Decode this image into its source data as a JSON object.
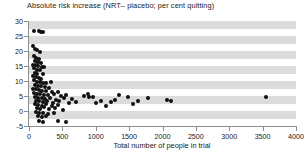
{
  "chart_data": {
    "type": "scatter",
    "title": "Absolute risk increase (NRT– placebo; per cent quitting)",
    "xlabel": "Total number of people in trial",
    "ylabel": "",
    "xlim": [
      0,
      4000
    ],
    "ylim": [
      -5,
      30
    ],
    "xticks": [
      0,
      500,
      1000,
      1500,
      2000,
      2500,
      3000,
      3500,
      4000
    ],
    "yticks": [
      -5,
      0,
      5,
      10,
      15,
      20,
      25,
      30
    ],
    "grid": "horizontal-bands",
    "legend": "none",
    "marker": {
      "shape": "circle",
      "color": "#101010",
      "size_px": 4
    },
    "background_bands": {
      "color": "#dcdcdc",
      "alternating_with": "#ffffff",
      "step": 2.5
    },
    "points": [
      {
        "x": 70,
        "y": 26.8
      },
      {
        "x": 150,
        "y": 26.6
      },
      {
        "x": 185,
        "y": 26.4
      },
      {
        "x": 205,
        "y": 26.5
      },
      {
        "x": 60,
        "y": 21.6
      },
      {
        "x": 90,
        "y": 20.6
      },
      {
        "x": 120,
        "y": 20.2
      },
      {
        "x": 165,
        "y": 19.6
      },
      {
        "x": 75,
        "y": 18.4
      },
      {
        "x": 110,
        "y": 17.6
      },
      {
        "x": 150,
        "y": 17.4
      },
      {
        "x": 95,
        "y": 16.6
      },
      {
        "x": 130,
        "y": 16.2
      },
      {
        "x": 175,
        "y": 16.0
      },
      {
        "x": 60,
        "y": 15.4
      },
      {
        "x": 100,
        "y": 15.2
      },
      {
        "x": 140,
        "y": 15.0
      },
      {
        "x": 190,
        "y": 14.8
      },
      {
        "x": 230,
        "y": 14.6
      },
      {
        "x": 70,
        "y": 14.2
      },
      {
        "x": 115,
        "y": 13.8
      },
      {
        "x": 160,
        "y": 13.6
      },
      {
        "x": 85,
        "y": 12.8
      },
      {
        "x": 125,
        "y": 12.4
      },
      {
        "x": 205,
        "y": 12.2
      },
      {
        "x": 55,
        "y": 11.6
      },
      {
        "x": 100,
        "y": 11.2
      },
      {
        "x": 145,
        "y": 11.0
      },
      {
        "x": 185,
        "y": 10.8
      },
      {
        "x": 75,
        "y": 10.2
      },
      {
        "x": 120,
        "y": 9.8
      },
      {
        "x": 165,
        "y": 9.6
      },
      {
        "x": 215,
        "y": 9.4
      },
      {
        "x": 260,
        "y": 9.2
      },
      {
        "x": 330,
        "y": 9.6
      },
      {
        "x": 90,
        "y": 8.6
      },
      {
        "x": 135,
        "y": 8.4
      },
      {
        "x": 180,
        "y": 8.2
      },
      {
        "x": 235,
        "y": 8.0
      },
      {
        "x": 300,
        "y": 7.8
      },
      {
        "x": 65,
        "y": 7.4
      },
      {
        "x": 110,
        "y": 7.2
      },
      {
        "x": 155,
        "y": 7.0
      },
      {
        "x": 200,
        "y": 6.8
      },
      {
        "x": 255,
        "y": 6.6
      },
      {
        "x": 350,
        "y": 6.4
      },
      {
        "x": 430,
        "y": 6.2
      },
      {
        "x": 80,
        "y": 6.0
      },
      {
        "x": 125,
        "y": 5.8
      },
      {
        "x": 170,
        "y": 5.6
      },
      {
        "x": 225,
        "y": 5.4
      },
      {
        "x": 290,
        "y": 5.2
      },
      {
        "x": 380,
        "y": 5.6
      },
      {
        "x": 480,
        "y": 5.0
      },
      {
        "x": 560,
        "y": 5.4
      },
      {
        "x": 95,
        "y": 4.6
      },
      {
        "x": 140,
        "y": 4.4
      },
      {
        "x": 190,
        "y": 4.2
      },
      {
        "x": 245,
        "y": 4.0
      },
      {
        "x": 320,
        "y": 4.4
      },
      {
        "x": 410,
        "y": 3.8
      },
      {
        "x": 520,
        "y": 4.2
      },
      {
        "x": 640,
        "y": 4.0
      },
      {
        "x": 105,
        "y": 3.4
      },
      {
        "x": 150,
        "y": 3.2
      },
      {
        "x": 210,
        "y": 3.0
      },
      {
        "x": 275,
        "y": 3.4
      },
      {
        "x": 360,
        "y": 2.8
      },
      {
        "x": 455,
        "y": 3.2
      },
      {
        "x": 600,
        "y": 2.6
      },
      {
        "x": 700,
        "y": 3.0
      },
      {
        "x": 85,
        "y": 2.2
      },
      {
        "x": 135,
        "y": 2.0
      },
      {
        "x": 195,
        "y": 1.8
      },
      {
        "x": 260,
        "y": 2.2
      },
      {
        "x": 340,
        "y": 1.6
      },
      {
        "x": 440,
        "y": 2.0
      },
      {
        "x": 115,
        "y": 1.0
      },
      {
        "x": 170,
        "y": 0.8
      },
      {
        "x": 230,
        "y": 1.2
      },
      {
        "x": 300,
        "y": 0.6
      },
      {
        "x": 395,
        "y": 1.0
      },
      {
        "x": 505,
        "y": 0.4
      },
      {
        "x": 100,
        "y": -0.4
      },
      {
        "x": 155,
        "y": -0.8
      },
      {
        "x": 215,
        "y": -0.6
      },
      {
        "x": 285,
        "y": -1.0
      },
      {
        "x": 370,
        "y": -0.8
      },
      {
        "x": 130,
        "y": -1.8
      },
      {
        "x": 190,
        "y": -2.0
      },
      {
        "x": 250,
        "y": -1.6
      },
      {
        "x": 145,
        "y": -3.2
      },
      {
        "x": 205,
        "y": -3.6
      },
      {
        "x": 430,
        "y": -3.4
      },
      {
        "x": 560,
        "y": -3.6
      },
      {
        "x": 820,
        "y": 5.0
      },
      {
        "x": 880,
        "y": 5.6
      },
      {
        "x": 905,
        "y": 4.8
      },
      {
        "x": 960,
        "y": 4.6
      },
      {
        "x": 1010,
        "y": 2.6
      },
      {
        "x": 1080,
        "y": 3.4
      },
      {
        "x": 1160,
        "y": 1.6
      },
      {
        "x": 1230,
        "y": 3.0
      },
      {
        "x": 1290,
        "y": 3.6
      },
      {
        "x": 1350,
        "y": 5.2
      },
      {
        "x": 1480,
        "y": 4.8
      },
      {
        "x": 1560,
        "y": 2.4
      },
      {
        "x": 1640,
        "y": 3.2
      },
      {
        "x": 1790,
        "y": 4.4
      },
      {
        "x": 2060,
        "y": 3.8
      },
      {
        "x": 2120,
        "y": 3.4
      },
      {
        "x": 3550,
        "y": 4.8
      }
    ]
  }
}
